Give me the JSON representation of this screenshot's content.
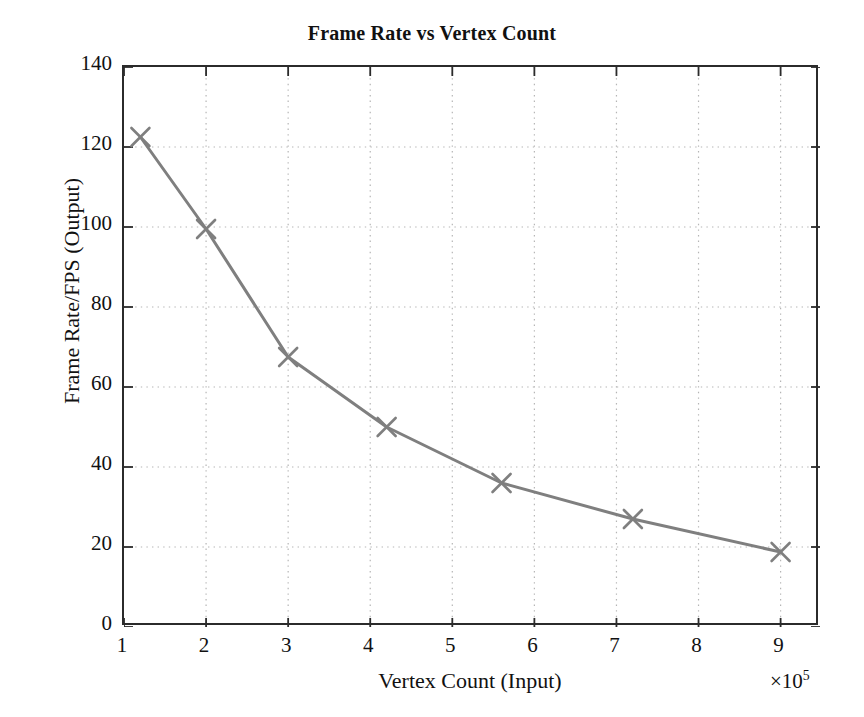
{
  "chart_data": {
    "type": "line",
    "title": "Frame Rate vs Vertex Count",
    "xlabel": "Vertex Count (Input)",
    "ylabel": "Frame Rate/FPS (Output)",
    "x_exponent_label": "×10",
    "x_exponent_power": "5",
    "x_scale_factor": 100000,
    "xlim": [
      1,
      9.48
    ],
    "ylim": [
      0,
      140
    ],
    "xticks": [
      1,
      2,
      3,
      4,
      5,
      6,
      7,
      8,
      9
    ],
    "yticks": [
      0,
      20,
      40,
      60,
      80,
      100,
      120,
      140
    ],
    "grid": true,
    "grid_style": "dotted",
    "legend": false,
    "marker": "x",
    "line_color": "#7f7f7f",
    "marker_color": "#7f7f7f",
    "grid_color": "#b5b5b5",
    "axis_color": "#2b2b2b",
    "x": [
      1.2,
      2.0,
      3.0,
      4.2,
      5.6,
      7.2,
      9.0
    ],
    "values": [
      122.5,
      99.5,
      67.5,
      50.0,
      36.0,
      27.0,
      18.75
    ],
    "points": [
      {
        "x": 1.2,
        "y": 122.5
      },
      {
        "x": 2.0,
        "y": 99.5
      },
      {
        "x": 3.0,
        "y": 67.5
      },
      {
        "x": 4.2,
        "y": 50.0
      },
      {
        "x": 5.6,
        "y": 36.0
      },
      {
        "x": 7.2,
        "y": 27.0
      },
      {
        "x": 9.0,
        "y": 18.75
      }
    ]
  }
}
